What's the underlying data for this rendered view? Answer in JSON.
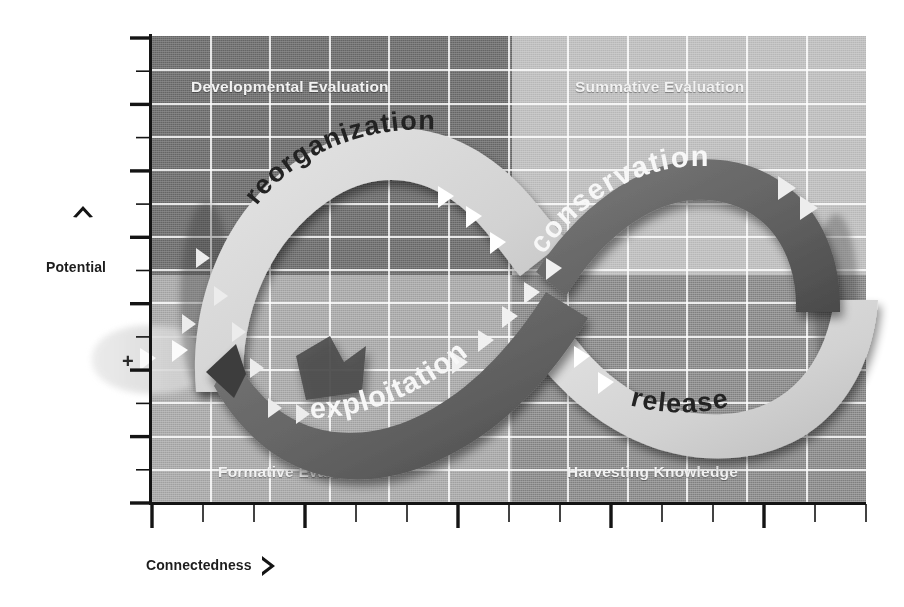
{
  "figure": {
    "type": "adaptive-cycle-panarchy-diagram",
    "axes": {
      "y": {
        "label": "Potential",
        "arrow_icon": "chevron-up-icon",
        "major_tick_count": 7,
        "minor_tick_count": 7
      },
      "x": {
        "label": "Connectedness",
        "arrow_icon": "chevron-right-icon",
        "major_tick_count": 5,
        "minor_tick_count": 9
      }
    },
    "quadrants": [
      {
        "id": "developmental",
        "label": "Developmental Evaluation",
        "position": "top-left",
        "fill": "#6f6f6f"
      },
      {
        "id": "summative",
        "label": "Summative Evaluation",
        "position": "top-right",
        "fill": "#bdbdbd"
      },
      {
        "id": "formative",
        "label": "Formative Evaluation",
        "position": "bottom-left",
        "fill": "#a8a8a8"
      },
      {
        "id": "harvesting",
        "label": "Harvesting Knowledge",
        "position": "bottom-right",
        "fill": "#8a8a8a"
      }
    ],
    "phases": [
      {
        "id": "reorganization",
        "label": "reorganization",
        "quadrant": "developmental",
        "band_tone": "light",
        "text_color": "#262626"
      },
      {
        "id": "conservation",
        "label": "conservation",
        "quadrant": "summative",
        "band_tone": "dark",
        "text_color": "#f5f5f5"
      },
      {
        "id": "exploitation",
        "label": "exploitation",
        "quadrant": "formative",
        "band_tone": "dark",
        "text_color": "#f5f5f5"
      },
      {
        "id": "release",
        "label": "release",
        "quadrant": "harvesting",
        "band_tone": "light",
        "text_color": "#262626"
      }
    ],
    "annotations": {
      "plus_sign": "+"
    },
    "colors": {
      "background": "#ffffff",
      "axis": "#141414",
      "gridline": "#ffffff",
      "band_dark": "#6a6a6a",
      "band_light": "#d6d6d6",
      "quad_label_text": "#f2f2f2"
    }
  },
  "chart_data": {
    "type": "line",
    "title": "",
    "xlabel": "Connectedness",
    "ylabel": "Potential",
    "xlim": [
      0,
      1
    ],
    "ylim": [
      0,
      1
    ],
    "grid": true,
    "legend": "none",
    "annotations": [
      "Developmental Evaluation",
      "Summative Evaluation",
      "Formative Evaluation",
      "Harvesting Knowledge",
      "reorganization",
      "conservation",
      "exploitation",
      "release",
      "+"
    ],
    "series": [
      {
        "name": "adaptive cycle (infinity loop)",
        "description": "Figure-eight adaptive cycle traversing exploitation, conservation, release and reorganization phases",
        "phase_order": [
          "exploitation",
          "conservation",
          "release",
          "reorganization"
        ]
      }
    ]
  }
}
